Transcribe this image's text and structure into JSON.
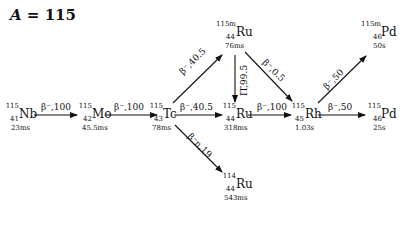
{
  "title": {
    "var": "A",
    "eq": " = 115"
  },
  "nuclides": [
    {
      "id": "nb115",
      "mass": "115",
      "z": "41",
      "sym": "Nb",
      "halflife": "23ms"
    },
    {
      "id": "mo115",
      "mass": "115",
      "z": "42",
      "sym": "Mo",
      "halflife": "45.5ms"
    },
    {
      "id": "tc115",
      "mass": "115",
      "z": "43",
      "sym": "Tc",
      "halflife": "78ms"
    },
    {
      "id": "ru115m",
      "mass": "115m",
      "z": "44",
      "sym": "Ru",
      "halflife": "76ms"
    },
    {
      "id": "ru115",
      "mass": "115",
      "z": "44",
      "sym": "Ru",
      "halflife": "318ms"
    },
    {
      "id": "ru114",
      "mass": "114",
      "z": "44",
      "sym": "Ru",
      "halflife": "543ms"
    },
    {
      "id": "rh115",
      "mass": "115",
      "z": "45",
      "sym": "Rh",
      "halflife": "1.03s"
    },
    {
      "id": "pd115m",
      "mass": "115m",
      "z": "46",
      "sym": "Pd",
      "halflife": "50s"
    },
    {
      "id": "pd115",
      "mass": "115",
      "z": "46",
      "sym": "Pd",
      "halflife": "25s"
    }
  ],
  "decays": [
    {
      "from": "Nb-115",
      "to": "Mo-115",
      "label": "β⁻,100"
    },
    {
      "from": "Mo-115",
      "to": "Tc-115",
      "label": "β⁻,100"
    },
    {
      "from": "Tc-115",
      "to": "Ru-115m",
      "label": "β⁻,40.5"
    },
    {
      "from": "Tc-115",
      "to": "Ru-115",
      "label": "β⁻,40.5"
    },
    {
      "from": "Tc-115",
      "to": "Ru-114",
      "label": "β⁻n,19"
    },
    {
      "from": "Ru-115m",
      "to": "Ru-115",
      "label": "IT,99.5"
    },
    {
      "from": "Ru-115m",
      "to": "Rh-115",
      "label": "β⁻,0.5"
    },
    {
      "from": "Ru-115",
      "to": "Rh-115",
      "label": "β⁻,100"
    },
    {
      "from": "Rh-115",
      "to": "Pd-115m",
      "label": "β⁻,50"
    },
    {
      "from": "Rh-115",
      "to": "Pd-115",
      "label": "β⁻,50"
    }
  ]
}
